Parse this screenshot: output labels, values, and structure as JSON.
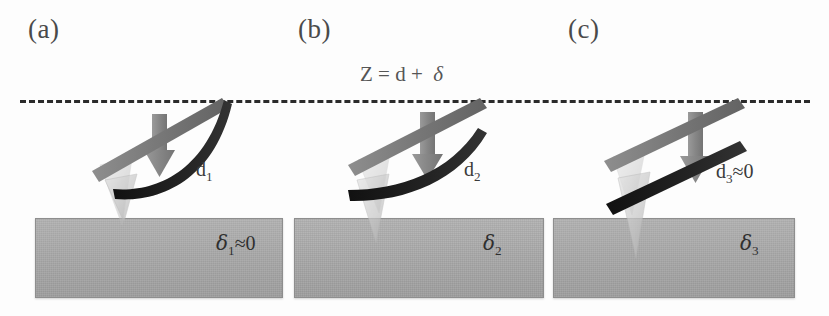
{
  "figure": {
    "caption_equation": "Z = d + δ",
    "background_color": "#fdfdfd",
    "width": 829,
    "height": 316
  },
  "colors": {
    "undeflected_cantilever": "#7a7a7a",
    "deflected_cantilever": "#1d1d1d",
    "tip": "#c9c9c9",
    "arrow": "#8c8c8c",
    "substrate": "#a9a9a9",
    "dashed_line": "#2b2b2b",
    "text": "#3a3a3a"
  },
  "equation": {
    "z": "Z",
    "equals": "=",
    "d": "d",
    "plus": "+",
    "delta": "δ",
    "full": "Z = d + δ"
  },
  "panels": [
    {
      "id": "a",
      "label": "(a)",
      "deflection_label": "d",
      "deflection_sub": "1",
      "deflection_suffix": "",
      "indentation_symbol": "δ",
      "indentation_sub": "1",
      "indentation_suffix": "≈0",
      "cantilever_shape": "strongly-curved",
      "description": "Hard sample: large cantilever deflection, negligible indentation"
    },
    {
      "id": "b",
      "label": "(b)",
      "deflection_label": "d",
      "deflection_sub": "2",
      "deflection_suffix": "",
      "indentation_symbol": "δ",
      "indentation_sub": "2",
      "indentation_suffix": "",
      "cantilever_shape": "slightly-curved",
      "description": "Intermediate sample: partial deflection and partial indentation"
    },
    {
      "id": "c",
      "label": "(c)",
      "deflection_label": "d",
      "deflection_sub": "3",
      "deflection_suffix": "≈0",
      "indentation_symbol": "δ",
      "indentation_sub": "3",
      "indentation_suffix": "",
      "cantilever_shape": "straight",
      "description": "Soft sample: negligible deflection, large indentation"
    }
  ],
  "icons": {
    "force_arrow": "down-arrow-icon",
    "probe_tip": "afm-tip-icon",
    "cantilever": "cantilever-beam-icon",
    "reference_line": "dashed-reference-line-icon"
  }
}
